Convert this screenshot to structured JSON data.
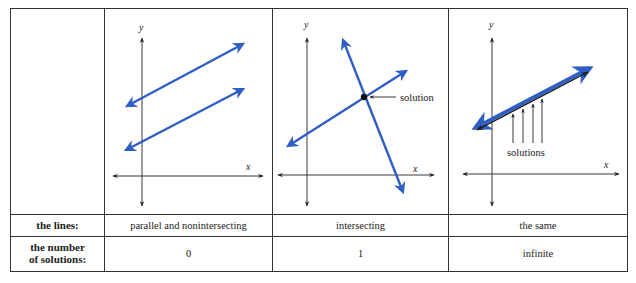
{
  "table": {
    "row_headers": {
      "lines": "the lines:",
      "number_line1": "the number",
      "number_line2": "of solutions:"
    },
    "columns": [
      {
        "lines_description": "parallel and nonintersecting",
        "number_of_solutions": "0",
        "graph": {
          "x_axis_label": "x",
          "y_axis_label": "y",
          "lines": [
            {
              "name": "upper-parallel-line",
              "slope": "positive"
            },
            {
              "name": "lower-parallel-line",
              "slope": "positive"
            }
          ]
        }
      },
      {
        "lines_description": "intersecting",
        "number_of_solutions": "1",
        "graph": {
          "x_axis_label": "x",
          "y_axis_label": "y",
          "annotation": "solution",
          "lines": [
            {
              "name": "positive-slope-line",
              "slope": "positive"
            },
            {
              "name": "negative-slope-line",
              "slope": "negative"
            }
          ]
        }
      },
      {
        "lines_description": "the same",
        "number_of_solutions": "infinite",
        "graph": {
          "x_axis_label": "x",
          "y_axis_label": "y",
          "annotation": "solutions",
          "lines": [
            {
              "name": "coincident-lines",
              "slope": "positive"
            }
          ]
        }
      }
    ]
  },
  "colors": {
    "line_blue": "#2f5fc4",
    "axis": "#222222",
    "border": "#333333"
  }
}
